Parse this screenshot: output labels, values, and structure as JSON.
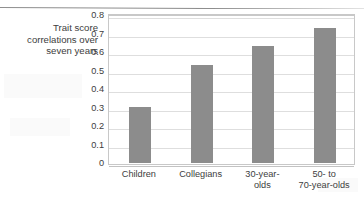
{
  "chart_data": {
    "type": "bar",
    "title": "",
    "subtitle": "",
    "xlabel": "",
    "ylabel": "Trait score correlations over seven years",
    "ylabel_lines": [
      "Trait score",
      "correlations over",
      "seven years"
    ],
    "categories": [
      "Children",
      "Collegians",
      "30-year-olds",
      "50- to 70-year-olds"
    ],
    "category_lines": [
      [
        "Children"
      ],
      [
        "Collegians"
      ],
      [
        "30-year-",
        "olds"
      ],
      [
        "50- to",
        "70-year-olds"
      ]
    ],
    "values": [
      0.305,
      0.53,
      0.63,
      0.73
    ],
    "ylim": [
      0,
      0.8
    ],
    "ytick_step": 0.1,
    "ytick_labels": [
      "0.8",
      "0.7",
      "0.6",
      "0.5",
      "0.4",
      "0.3",
      "0.2",
      "0.1",
      "0"
    ],
    "ytick_values": [
      0.8,
      0.7,
      0.6,
      0.5,
      0.4,
      0.3,
      0.2,
      0.1,
      0
    ],
    "grid": true,
    "grid_axis": "y",
    "legend": false,
    "legend_position": "none",
    "orientation": "vertical",
    "series": [
      {
        "name": "Trait score correlations over seven years",
        "values": [
          0.305,
          0.53,
          0.63,
          0.73
        ]
      }
    ]
  },
  "colors": {
    "bar_fill": "#8c8c8c",
    "gridline": "#dedede",
    "plot_border": "#c8c8c8",
    "axis_text": "#3d3d3d",
    "background": "#ffffff",
    "scan_rule": "#8e8e8e"
  }
}
